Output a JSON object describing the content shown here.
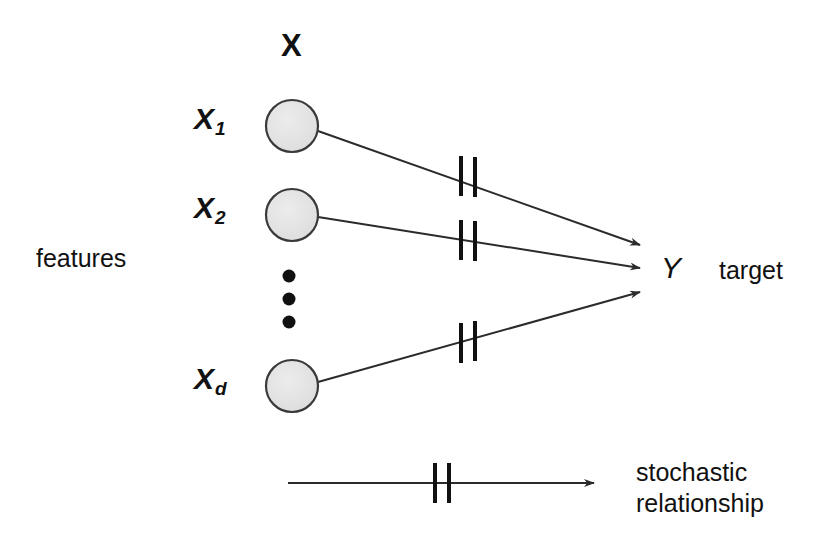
{
  "figure": {
    "title_label": "X",
    "features_label": "features",
    "target_label": "target",
    "target_variable": "Y",
    "ellipsis_glyph": "•",
    "legend": {
      "line1": "stochastic",
      "line2": "relationship"
    },
    "colors": {
      "node_fill": "#e3e3e3",
      "node_stroke": "#3a3a3a",
      "edge": "#2b2b2b",
      "text": "#111111",
      "background": "#ffffff"
    }
  },
  "nodes": [
    {
      "id": "x1",
      "label": "X",
      "subscript": "1",
      "cx": 292,
      "cy": 126,
      "r": 26
    },
    {
      "id": "x2",
      "label": "X",
      "subscript": "2",
      "cx": 292,
      "cy": 215,
      "r": 26
    },
    {
      "id": "xd",
      "label": "X",
      "subscript": "d",
      "cx": 292,
      "cy": 386,
      "r": 26
    }
  ],
  "ellipsis_dots": [
    {
      "cx": 289,
      "cy": 276,
      "r": 6
    },
    {
      "cx": 289,
      "cy": 299,
      "r": 6
    },
    {
      "cx": 289,
      "cy": 322,
      "r": 6
    }
  ],
  "edges": [
    {
      "id": "edge-x1-y",
      "from": "x1",
      "to": "Y",
      "x1": 318,
      "y1": 131,
      "x2": 640,
      "y2": 245,
      "tick_x": 466,
      "tick_label": "stochastic-tick"
    },
    {
      "id": "edge-x2-y",
      "from": "x2",
      "to": "Y",
      "x1": 318,
      "y1": 217,
      "x2": 640,
      "y2": 268,
      "tick_x": 466,
      "tick_label": "stochastic-tick"
    },
    {
      "id": "edge-xd-y",
      "from": "xd",
      "to": "Y",
      "x1": 318,
      "y1": 382,
      "x2": 640,
      "y2": 292,
      "tick_x": 466,
      "tick_label": "stochastic-tick"
    }
  ],
  "legend_arrow": {
    "x1": 288,
    "y1": 483,
    "x2": 594,
    "y2": 483,
    "tick_x": 440
  },
  "label_positions": {
    "vector_x": {
      "x": 281,
      "y": 30
    },
    "features": {
      "x": 36,
      "y": 246
    },
    "x1": {
      "x": 194,
      "y": 104
    },
    "x2": {
      "x": 194,
      "y": 193
    },
    "xd": {
      "x": 194,
      "y": 364
    },
    "target_variable": {
      "x": 661,
      "y": 253
    },
    "target": {
      "x": 719,
      "y": 258
    },
    "legend_text": {
      "x": 636,
      "y": 457
    }
  }
}
